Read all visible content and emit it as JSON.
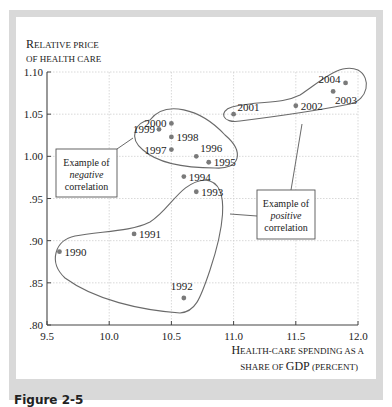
{
  "chart_data": {
    "type": "scatter",
    "title": "",
    "ylabel": "Relative price of health care",
    "xlabel": "Health-care spending as a share of GDP (percent)",
    "xlim": [
      9.5,
      12.0
    ],
    "ylim": [
      0.8,
      1.1
    ],
    "x_ticks": [
      "9.5",
      "10.0",
      "10.5",
      "11.0",
      "11.5",
      "12.0"
    ],
    "y_ticks": [
      ".80",
      ".85",
      ".90",
      ".95",
      "1.00",
      "1.05",
      "1.10"
    ],
    "grid": true,
    "points": [
      {
        "label": "1990",
        "x": 9.6,
        "y": 0.887
      },
      {
        "label": "1991",
        "x": 10.2,
        "y": 0.908
      },
      {
        "label": "1992",
        "x": 10.6,
        "y": 0.832
      },
      {
        "label": "1993",
        "x": 10.7,
        "y": 0.958
      },
      {
        "label": "1994",
        "x": 10.6,
        "y": 0.976
      },
      {
        "label": "1995",
        "x": 10.8,
        "y": 0.993
      },
      {
        "label": "1996",
        "x": 10.7,
        "y": 1.0
      },
      {
        "label": "1997",
        "x": 10.5,
        "y": 1.008
      },
      {
        "label": "1998",
        "x": 10.5,
        "y": 1.023
      },
      {
        "label": "1999",
        "x": 10.4,
        "y": 1.032
      },
      {
        "label": "2000",
        "x": 10.5,
        "y": 1.039
      },
      {
        "label": "2001",
        "x": 11.0,
        "y": 1.05
      },
      {
        "label": "2002",
        "x": 11.5,
        "y": 1.06
      },
      {
        "label": "2003",
        "x": 11.8,
        "y": 1.077
      },
      {
        "label": "2004",
        "x": 11.9,
        "y": 1.087
      }
    ],
    "annotations": [
      {
        "text": [
          "Example of",
          "negative",
          "correlation"
        ],
        "encloses": [
          "1995",
          "1996",
          "1997",
          "1998",
          "1999",
          "2000"
        ]
      },
      {
        "text": [
          "Example of",
          "positive",
          "correlation"
        ],
        "encloses": [
          "1990",
          "1991",
          "1992",
          "1993"
        ],
        "also_points_to": [
          "2001",
          "2002",
          "2003",
          "2004"
        ]
      }
    ]
  },
  "labels": {
    "ylabel_line1_cap": "R",
    "ylabel_line1_rest": "ELATIVE PRICE",
    "ylabel_line2": "OF HEALTH CARE",
    "xlabel_line1_cap": "H",
    "xlabel_line1_rest": "EALTH-CARE SPENDING AS A",
    "xlabel_line2_a": "SHARE OF ",
    "xlabel_line2_b": "GDP",
    "xlabel_line2_c": " (PERCENT)",
    "neg_box": [
      "Example of",
      "negative",
      "correlation"
    ],
    "pos_box": [
      "Example of",
      "positive",
      "correlation"
    ],
    "caption": "Figure 2-5"
  },
  "colors": {
    "point": "#7a7a7a",
    "curve": "#6a6a6a",
    "grid": "#cfcfcf",
    "axis": "#444444",
    "frame": "#d9d9d9"
  }
}
